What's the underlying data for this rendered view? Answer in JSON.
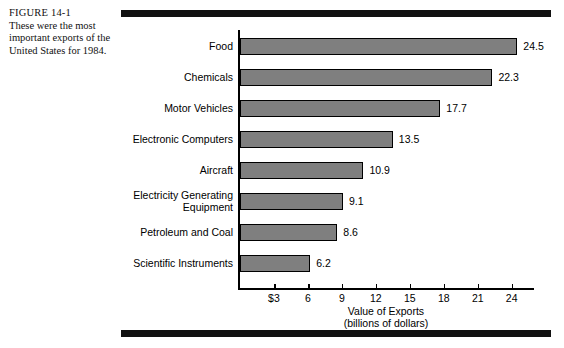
{
  "caption": {
    "figure_number": "FIGURE 14-1",
    "description": "These were the most important exports of the United States for 1984."
  },
  "chart_data": {
    "type": "bar",
    "orientation": "horizontal",
    "title": "",
    "xlabel": "Value of Exports",
    "xlabel_sub": "(billions of dollars)",
    "ylabel": "",
    "categories": [
      "Food",
      "Chemicals",
      "Motor Vehicles",
      "Electronic Computers",
      "Aircraft",
      "Electricity Generating\nEquipment",
      "Petroleum and Coal",
      "Scientific Instruments"
    ],
    "values": [
      24.5,
      22.3,
      17.7,
      13.5,
      10.9,
      9.1,
      8.6,
      6.2
    ],
    "value_labels": [
      "24.5",
      "22.3",
      "17.7",
      "13.5",
      "10.9",
      "9.1",
      "8.6",
      "6.2"
    ],
    "xlim": [
      0,
      26
    ],
    "xticks": [
      3,
      6,
      9,
      12,
      15,
      18,
      21,
      24
    ],
    "xtick_labels": [
      "$3",
      "6",
      "9",
      "12",
      "15",
      "18",
      "21",
      "24"
    ],
    "grid": false,
    "legend": false,
    "bar_fill_color": "#7f7f7f",
    "bar_border_color": "#000000",
    "axis_color": "#000000",
    "background_color": "#ffffff",
    "rule_color": "#111111"
  }
}
